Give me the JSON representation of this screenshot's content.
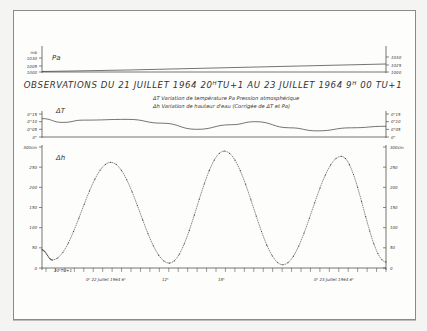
{
  "title": "OBSERVATIONS DU 21 JUILLET 1964 20ᴴTU+1 AU 23 JUILLET 1964 9ᴴ 00 TU+1",
  "legend": {
    "line1": "ΔT Variation de température     Pa Pression atmosphérique",
    "line2": "Δh Variation de hauteur d'eau  (Corrigée de ΔT et Pa)"
  },
  "colors": {
    "ink": "#3a3a3a",
    "paper": "#fdfdfc",
    "frame": "#8a8a8a"
  },
  "chart_data": [
    {
      "type": "line",
      "id": "pa",
      "title": "Pa",
      "ylabel": "mb",
      "yticks": [
        "1000",
        "1005",
        "1030"
      ],
      "right_yticks": [
        "1030",
        "1025",
        "1000"
      ],
      "ylim": [
        1000,
        1030
      ],
      "x": [
        0,
        0.25,
        0.5,
        0.75,
        1.0
      ],
      "values": [
        1001,
        1004,
        1008,
        1012,
        1016
      ],
      "note": "slowly rising pressure trace"
    },
    {
      "type": "line",
      "id": "dt",
      "title": "ΔT",
      "yticks": [
        "0°",
        "0°05",
        "0°10",
        "0°15"
      ],
      "ylim": [
        0,
        0.15
      ],
      "x": [
        0,
        0.06,
        0.12,
        0.25,
        0.35,
        0.45,
        0.55,
        0.62,
        0.72,
        0.8,
        0.9,
        1.0
      ],
      "values": [
        0.12,
        0.095,
        0.11,
        0.115,
        0.09,
        0.05,
        0.08,
        0.1,
        0.06,
        0.04,
        0.06,
        0.07
      ]
    },
    {
      "type": "line",
      "id": "dh",
      "title": "Δh",
      "ylabel": "cm",
      "yticks": [
        "0",
        "50",
        "100",
        "150",
        "200",
        "250",
        "300cm"
      ],
      "ylim": [
        0,
        300
      ],
      "xtick_labels": [
        "20ʰTU+1",
        "0ʰ 22 Juillet 1964 6ʰ",
        "12ʰ",
        "18ʰ",
        "0ʰ 23 Juillet 1964 6ʰ"
      ],
      "extrema": [
        {
          "kind": "start",
          "t": 0,
          "value": 45
        },
        {
          "kind": "min",
          "t": 0.03,
          "value": 20
        },
        {
          "kind": "max",
          "t": 0.2,
          "value": 262
        },
        {
          "kind": "min",
          "t": 0.37,
          "value": 12
        },
        {
          "kind": "max",
          "t": 0.53,
          "value": 290
        },
        {
          "kind": "min",
          "t": 0.7,
          "value": 8
        },
        {
          "kind": "max",
          "t": 0.87,
          "value": 277
        },
        {
          "kind": "end",
          "t": 1.0,
          "value": 15
        }
      ],
      "style": "dotted line with point markers"
    }
  ]
}
